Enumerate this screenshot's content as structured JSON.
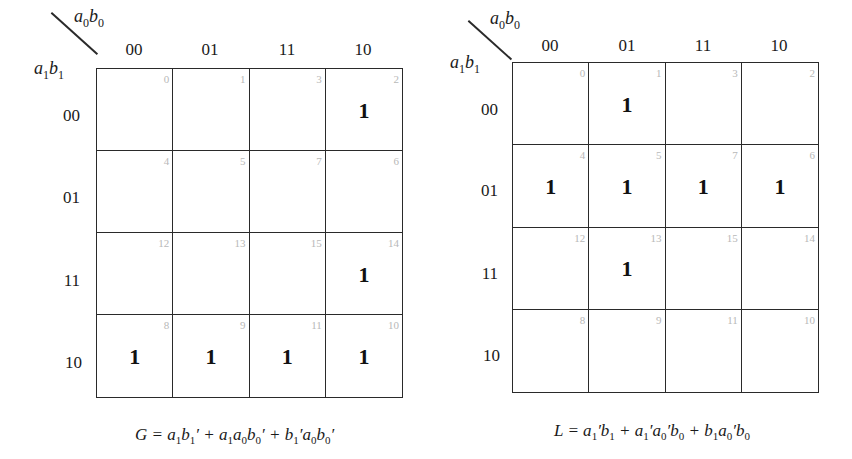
{
  "maps": [
    {
      "name": "G",
      "col_var": "a0b0",
      "row_var": "a1b1",
      "col_headers": [
        "00",
        "01",
        "11",
        "10"
      ],
      "row_headers": [
        "00",
        "01",
        "11",
        "10"
      ],
      "minterms": [
        [
          "0",
          "1",
          "3",
          "2"
        ],
        [
          "4",
          "5",
          "7",
          "6"
        ],
        [
          "12",
          "13",
          "15",
          "14"
        ],
        [
          "8",
          "9",
          "11",
          "10"
        ]
      ],
      "values": [
        [
          "",
          "",
          "",
          "1"
        ],
        [
          "",
          "",
          "",
          ""
        ],
        [
          "",
          "",
          "",
          "1"
        ],
        [
          "1",
          "1",
          "1",
          "1"
        ]
      ],
      "equation": "G = a1b1′ + a1a0b0′ + b1′a0b0′"
    },
    {
      "name": "L",
      "col_var": "a0b0",
      "row_var": "a1b1",
      "col_headers": [
        "00",
        "01",
        "11",
        "10"
      ],
      "row_headers": [
        "00",
        "01",
        "11",
        "10"
      ],
      "minterms": [
        [
          "0",
          "1",
          "3",
          "2"
        ],
        [
          "4",
          "5",
          "7",
          "6"
        ],
        [
          "12",
          "13",
          "15",
          "14"
        ],
        [
          "8",
          "9",
          "11",
          "10"
        ]
      ],
      "values": [
        [
          "",
          "1",
          "",
          ""
        ],
        [
          "1",
          "1",
          "1",
          "1"
        ],
        [
          "",
          "1",
          "",
          ""
        ],
        [
          "",
          "",
          "",
          ""
        ]
      ],
      "equation": "L = a1′b1 + a1′a0′b0 + b1a0′b0"
    }
  ]
}
